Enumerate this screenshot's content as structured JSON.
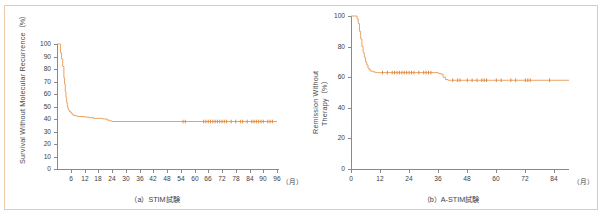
{
  "figure": {
    "border_color": "#e9c9a8",
    "background": "#ffffff",
    "curve_color": "#e8a365",
    "censor_color": "#e08b3c",
    "axis_color": "#8a8a8a"
  },
  "panels": [
    {
      "id": "a",
      "caption": "（a）STIM試験",
      "ylabel": "Survival Without Molecular Recurrence（%）",
      "ylabel_lines": [
        "Survival Without Molecular Recurrence（%）"
      ],
      "xunit": "（月）"
    },
    {
      "id": "b",
      "caption": "（b）A-STIM試験",
      "ylabel": "Remission Without Therapy（%）",
      "ylabel_lines": [
        "Remission Without",
        "Therapy（%）"
      ],
      "xunit": "（月）"
    }
  ],
  "chart_data": [
    {
      "type": "line",
      "id": "stim",
      "title": "（a）STIM試験",
      "xlabel": "（月）",
      "ylabel": "Survival Without Molecular Recurrence（%）",
      "xlim": [
        0,
        96
      ],
      "ylim": [
        0,
        100
      ],
      "xticks": [
        6,
        12,
        18,
        24,
        30,
        36,
        42,
        48,
        54,
        60,
        66,
        72,
        78,
        84,
        90,
        96
      ],
      "yticks": [
        0,
        10,
        20,
        30,
        40,
        50,
        60,
        70,
        80,
        90,
        100
      ],
      "grid": false,
      "legend": "none",
      "series": [
        {
          "name": "Survival without molecular recurrence",
          "step": "post",
          "x": [
            0,
            1,
            1.5,
            2,
            2.5,
            3,
            3.3,
            3.6,
            3.9,
            4.2,
            4.5,
            4.8,
            5.1,
            5.5,
            6,
            6.5,
            7,
            8,
            9,
            10,
            12,
            14,
            16,
            18,
            20,
            22,
            23,
            24,
            96
          ],
          "y": [
            100,
            100,
            93,
            88,
            82,
            73,
            68,
            62,
            57,
            53,
            50,
            48,
            47,
            46,
            45,
            44,
            43,
            42.5,
            42,
            42,
            41.5,
            41,
            40.5,
            40.5,
            40,
            39,
            38.5,
            38,
            38
          ]
        }
      ],
      "censored_months": [
        55,
        56,
        64,
        65,
        66,
        67,
        68,
        69,
        70,
        71,
        72,
        73,
        74,
        76,
        78,
        80,
        81,
        83,
        85,
        86,
        87,
        88,
        89,
        90,
        92,
        93,
        94
      ]
    },
    {
      "type": "line",
      "id": "a-stim",
      "title": "（b）A-STIM試験",
      "xlabel": "（月）",
      "ylabel": "Remission Without Therapy（%）",
      "xlim": [
        0,
        90
      ],
      "ylim": [
        0,
        100
      ],
      "xticks": [
        0,
        12,
        24,
        36,
        48,
        60,
        72,
        84
      ],
      "yticks": [
        0,
        20,
        40,
        60,
        80,
        100
      ],
      "grid": false,
      "legend": "none",
      "series": [
        {
          "name": "Remission without therapy",
          "step": "post",
          "x": [
            0,
            2,
            2.5,
            3,
            3.5,
            4,
            4.5,
            5,
            5.5,
            6,
            6.5,
            7,
            7.5,
            8,
            9,
            10,
            11,
            12,
            24,
            33,
            36,
            37,
            38,
            39,
            40,
            90
          ],
          "y": [
            100,
            100,
            98,
            95,
            90,
            85,
            80,
            76,
            73,
            70,
            68,
            66,
            65,
            64,
            63.5,
            63,
            63,
            63,
            63,
            63,
            62.5,
            62,
            60,
            58.5,
            58,
            58
          ]
        }
      ],
      "censored_months": [
        13,
        15,
        17,
        18,
        19,
        20,
        21,
        22,
        23,
        24,
        25,
        26,
        28,
        30,
        31,
        32,
        33,
        42,
        44,
        45,
        48,
        50,
        52,
        54,
        55,
        56,
        60,
        62,
        66,
        68,
        72,
        73,
        74,
        82
      ]
    }
  ]
}
